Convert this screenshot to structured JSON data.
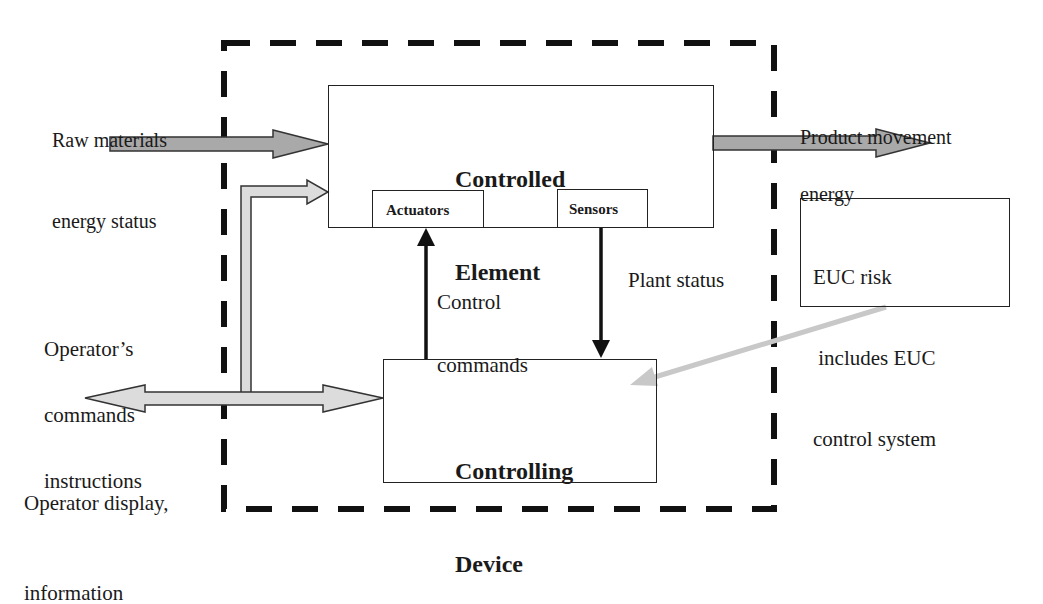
{
  "diagram": {
    "type": "EUC control system block diagram",
    "boundary": {
      "style": "dashed",
      "color": "#111111"
    },
    "blocks": {
      "controlled_element": {
        "title_line1": "Controlled",
        "title_line2": "Element",
        "actuators": "Actuators",
        "sensors": "Sensors"
      },
      "controlling_device": {
        "title_line1": "Controlling",
        "title_line2": "Device"
      },
      "euc_note": {
        "line1": "EUC risk",
        "line2": " includes EUC",
        "line3": "control system"
      }
    },
    "labels": {
      "raw_materials_line1": "Raw materials",
      "raw_materials_line2": "energy status",
      "product_line1": "Product movement",
      "product_line2": "energy",
      "operator_commands_line1": "Operator’s",
      "operator_commands_line2": "commands",
      "operator_commands_line3": "instructions",
      "operator_display_line1": "Operator display,",
      "operator_display_line2": "information",
      "control_commands_line1": "Control",
      "control_commands_line2": "commands",
      "plant_status": "Plant status"
    },
    "colors": {
      "dark_arrow_fill": "#a9a9a9",
      "light_arrow_fill": "#dcdcdc",
      "leader_line": "#c8c8c8",
      "stroke": "#222222"
    }
  }
}
